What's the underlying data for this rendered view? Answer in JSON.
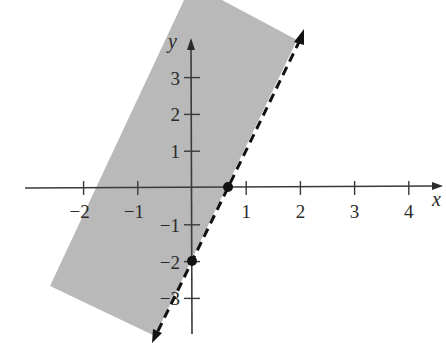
{
  "chart_data": {
    "type": "inequality_graph",
    "title": "",
    "xlabel": "x",
    "ylabel": "y",
    "x_ticks": [
      -2,
      -1,
      1,
      2,
      3,
      4
    ],
    "x_tick_labels": [
      "−2",
      "−1",
      "1",
      "2",
      "3",
      "4"
    ],
    "y_ticks": [
      -3,
      -2,
      -1,
      1,
      2,
      3
    ],
    "y_tick_labels": [
      "−3",
      "−2",
      "−1",
      "1",
      "2",
      "3"
    ],
    "xlim": [
      -3,
      4.7
    ],
    "ylim": [
      -4.2,
      5
    ],
    "grid": false,
    "boundary_line": {
      "equation": "y = 3x - 2",
      "slope": 3,
      "intercept": -2,
      "style": "dashed",
      "arrows": "both"
    },
    "shaded_region": {
      "description": "y > 3x - 2 (left/above the dashed line)",
      "color": "#b8b8b8"
    },
    "points": [
      {
        "x": 0.667,
        "y": 0,
        "label": "x-intercept",
        "filled": true
      },
      {
        "x": 0,
        "y": -2,
        "label": "y-intercept",
        "filled": true
      }
    ]
  },
  "colors": {
    "shade": "#b9b9b9",
    "axis": "#3a3a3a",
    "line": "#111111",
    "text": "#2a2a2a"
  }
}
